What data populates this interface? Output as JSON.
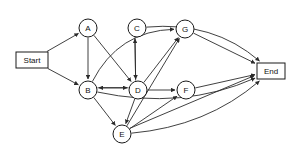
{
  "diagram": {
    "background_color": "#ffffff",
    "stroke_color": "#2b2b2b",
    "node_fill": "#ffffff",
    "nodes": [
      {
        "id": "Start",
        "label": "Start",
        "shape": "rect",
        "x": 32,
        "y": 60,
        "w": 32,
        "h": 16
      },
      {
        "id": "A",
        "label": "A",
        "shape": "circle",
        "x": 88,
        "y": 28,
        "r": 9
      },
      {
        "id": "C",
        "label": "C",
        "shape": "circle",
        "x": 137,
        "y": 28,
        "r": 9
      },
      {
        "id": "G",
        "label": "G",
        "shape": "circle",
        "x": 185,
        "y": 29,
        "r": 9
      },
      {
        "id": "B",
        "label": "B",
        "shape": "circle",
        "x": 88,
        "y": 90,
        "r": 9
      },
      {
        "id": "D",
        "label": "D",
        "shape": "circle",
        "x": 138,
        "y": 90,
        "r": 9
      },
      {
        "id": "F",
        "label": "F",
        "shape": "circle",
        "x": 186,
        "y": 90,
        "r": 9
      },
      {
        "id": "E",
        "label": "E",
        "shape": "circle",
        "x": 122,
        "y": 134,
        "r": 9
      },
      {
        "id": "End",
        "label": "End",
        "shape": "rect",
        "x": 271,
        "y": 71,
        "w": 28,
        "h": 16
      }
    ],
    "edges": [
      {
        "from": "Start",
        "to": "A",
        "kind": "line"
      },
      {
        "from": "Start",
        "to": "B",
        "kind": "line"
      },
      {
        "from": "A",
        "to": "B",
        "kind": "line"
      },
      {
        "from": "A",
        "to": "D",
        "kind": "line"
      },
      {
        "from": "B",
        "to": "D",
        "kind": "line"
      },
      {
        "from": "D",
        "to": "B",
        "kind": "line"
      },
      {
        "from": "B",
        "to": "G",
        "kind": "curve"
      },
      {
        "from": "B",
        "to": "E",
        "kind": "line"
      },
      {
        "from": "D",
        "to": "C",
        "kind": "line"
      },
      {
        "from": "C",
        "to": "D",
        "kind": "line"
      },
      {
        "from": "D",
        "to": "G",
        "kind": "line"
      },
      {
        "from": "D",
        "to": "F",
        "kind": "line"
      },
      {
        "from": "D",
        "to": "E",
        "kind": "line"
      },
      {
        "from": "G",
        "to": "End",
        "kind": "line"
      },
      {
        "from": "F",
        "to": "End",
        "kind": "line"
      },
      {
        "from": "C",
        "to": "End",
        "kind": "curve"
      },
      {
        "from": "E",
        "to": "G",
        "kind": "line"
      },
      {
        "from": "E",
        "to": "F",
        "kind": "line"
      },
      {
        "from": "E",
        "to": "End",
        "kind": "line"
      },
      {
        "from": "E",
        "to": "End",
        "kind": "curve"
      },
      {
        "from": "B",
        "to": "End",
        "kind": "curve"
      }
    ]
  }
}
